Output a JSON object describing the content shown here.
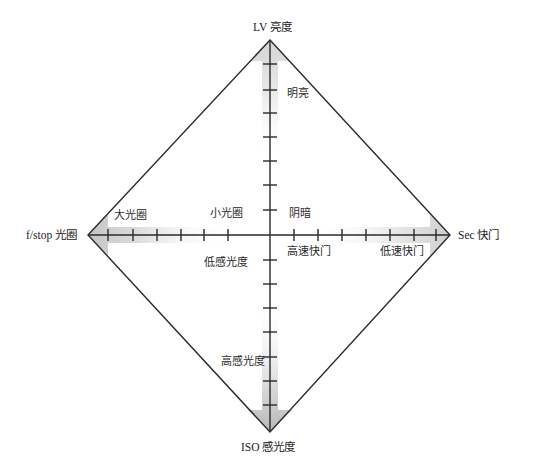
{
  "diagram": {
    "colors": {
      "background": "#ffffff",
      "line": "#2a2a2a",
      "shade": "#c8c8c8",
      "text": "#2a2a2a"
    },
    "center": {
      "x": 270,
      "y": 235
    },
    "vertices": {
      "top": {
        "x": 270,
        "y": 40
      },
      "left": {
        "x": 88,
        "y": 235
      },
      "right": {
        "x": 450,
        "y": 235
      },
      "bottom": {
        "x": 270,
        "y": 432
      }
    },
    "axes": {
      "top": {
        "label": "LV 亮度"
      },
      "left": {
        "label": "f/stop 光圈"
      },
      "right": {
        "label": "Sec 快门"
      },
      "bottom": {
        "label": "ISO 感光度"
      }
    },
    "region_labels": {
      "bright": "明亮",
      "dark": "阴暗",
      "large_aperture": "大光圈",
      "small_aperture": "小光圈",
      "high_speed_shutter": "高速快门",
      "low_speed_shutter": "低速快门",
      "low_sensitivity": "低感光度",
      "high_sensitivity": "高感光度"
    },
    "ticks": {
      "horizontal_x": [
        108,
        133,
        157,
        181,
        204,
        228,
        294,
        318,
        342,
        366,
        390,
        414,
        436
      ],
      "vertical_y": [
        64,
        90,
        113,
        137,
        161,
        185,
        210,
        260,
        284,
        308,
        332,
        357,
        381,
        405
      ]
    }
  }
}
